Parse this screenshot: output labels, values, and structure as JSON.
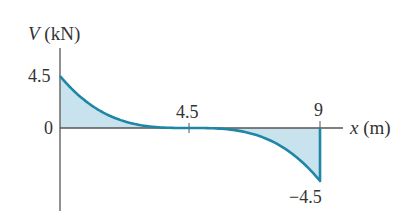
{
  "chart_data": {
    "type": "area",
    "title": "",
    "xlabel": "x (m)",
    "ylabel": "V (kN)",
    "ylabel_var": "V",
    "ylabel_unit": "(kN)",
    "xlabel_var": "x",
    "xlabel_unit": "(m)",
    "x_ticks": [
      {
        "value": 4.5,
        "label": "4.5"
      },
      {
        "value": 9,
        "label": "9"
      }
    ],
    "y_ticks": [
      {
        "value": 4.5,
        "label": "4.5"
      },
      {
        "value": 0,
        "label": "0"
      },
      {
        "value": -4.5,
        "label": "−4.5"
      }
    ],
    "xlim": [
      0,
      9
    ],
    "ylim": [
      -4.5,
      4.5
    ],
    "grid": false,
    "legend": null,
    "series": [
      {
        "name": "Shear force V(x)",
        "function": "V = -(x - 4.5)^3 / 20.25",
        "x": [
          0,
          1,
          2,
          3,
          4,
          4.5,
          5,
          6,
          7,
          8,
          9
        ],
        "values": [
          4.5,
          2.12,
          0.77,
          0.17,
          0.01,
          0,
          -0.01,
          -0.17,
          -0.77,
          -2.12,
          -4.5
        ]
      }
    ],
    "colors": {
      "curve": "#1f86a6",
      "fill": "#c9e3ee",
      "axis": "#555555",
      "text": "#333333"
    }
  }
}
